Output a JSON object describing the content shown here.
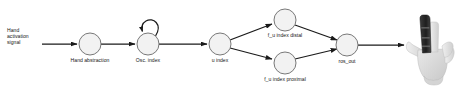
{
  "diagram": {
    "type": "flow-graph",
    "background_color": "#ffffff",
    "node_fill_color": "#f2f2f2",
    "node_stroke_color": "#6a6a6a",
    "edge_color": "#1a1a1a",
    "input_label": "Hand\nactivation\nsignal",
    "input_label_lines": [
      "Hand",
      "activation",
      "signal"
    ],
    "nodes": [
      {
        "id": "hand_abstraction",
        "label": "Hand abstraction",
        "cx": 90,
        "cy": 44,
        "r": 11,
        "label_x": 90,
        "label_y": 58
      },
      {
        "id": "osc_index",
        "label": "Osc. index",
        "cx": 148,
        "cy": 44,
        "r": 11,
        "label_x": 148,
        "label_y": 58
      },
      {
        "id": "u_index",
        "label": "u index",
        "cx": 220,
        "cy": 44,
        "r": 11,
        "label_x": 220,
        "label_y": 58
      },
      {
        "id": "f_u_index_distal",
        "label": "f_u index distal",
        "cx": 285,
        "cy": 20,
        "r": 11,
        "label_x": 285,
        "label_y": 33
      },
      {
        "id": "f_u_index_proximal",
        "label": "f_u index proximal",
        "cx": 285,
        "cy": 63,
        "r": 11,
        "label_x": 285,
        "label_y": 75
      },
      {
        "id": "ros_out",
        "label": "ros_out",
        "cx": 347,
        "cy": 45,
        "r": 11,
        "label_x": 347,
        "label_y": 59
      }
    ],
    "edges": [
      {
        "from": "input",
        "to": "hand_abstraction",
        "kind": "arrow"
      },
      {
        "from": "hand_abstraction",
        "to": "osc_index",
        "kind": "arrow"
      },
      {
        "from": "osc_index",
        "to": "osc_index",
        "kind": "self-loop"
      },
      {
        "from": "osc_index",
        "to": "u_index",
        "kind": "arrow"
      },
      {
        "from": "u_index",
        "to": "f_u_index_distal",
        "kind": "arrow"
      },
      {
        "from": "u_index",
        "to": "f_u_index_proximal",
        "kind": "arrow"
      },
      {
        "from": "f_u_index_distal",
        "to": "ros_out",
        "kind": "arrow"
      },
      {
        "from": "f_u_index_proximal",
        "to": "ros_out",
        "kind": "arrow"
      },
      {
        "from": "ros_out",
        "to": "hand_image",
        "kind": "arrow"
      }
    ],
    "image": {
      "name": "robotic-hand-photo",
      "description": "Grayscale photo of a robotic prosthetic hand with index finger raised"
    }
  }
}
